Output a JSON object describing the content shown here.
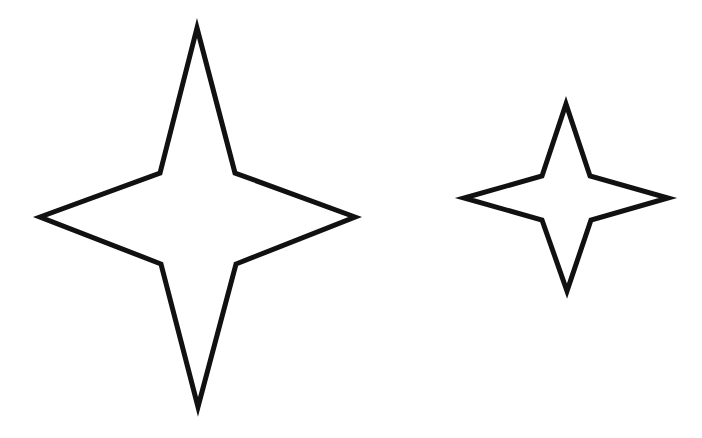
{
  "canvas": {
    "width": 702,
    "height": 438,
    "background": "#ffffff"
  },
  "shapes": [
    {
      "name": "large-four-point-star",
      "points": "197,28 235,173 355,217 236,264 198,407 161,264 40,217 160,173",
      "stroke": "#111111",
      "fill": "#ffffff"
    },
    {
      "name": "small-four-point-star",
      "points": "566,104 590,176 668,198 591,220 567,291 542,220 464,198 542,176",
      "stroke": "#111111",
      "fill": "#ffffff"
    }
  ]
}
